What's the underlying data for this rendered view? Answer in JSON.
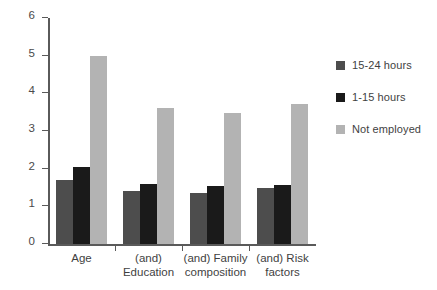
{
  "chart_data": {
    "type": "bar",
    "title": "",
    "subtitle": "",
    "xlabel": "",
    "ylabel": "",
    "ylim": [
      0,
      6
    ],
    "y_ticks": [
      "0",
      "1",
      "2",
      "3",
      "4",
      "5",
      "6"
    ],
    "grid": false,
    "legend_position": "right",
    "categories": [
      "Age",
      "(and)\nEducation",
      "(and) Family\ncomposition",
      "(and) Risk\nfactors"
    ],
    "series": [
      {
        "name": "15-24 hours",
        "color": "#4d4d4d",
        "values": [
          1.7,
          1.42,
          1.36,
          1.48
        ]
      },
      {
        "name": "1-15 hours",
        "color": "#1a1a1a",
        "values": [
          2.05,
          1.6,
          1.54,
          1.56
        ]
      },
      {
        "name": "Not employed",
        "color": "#b3b3b3",
        "values": [
          5.0,
          3.6,
          3.47,
          3.72
        ]
      }
    ]
  },
  "axis": {
    "line_color": "#5a5a5a"
  }
}
